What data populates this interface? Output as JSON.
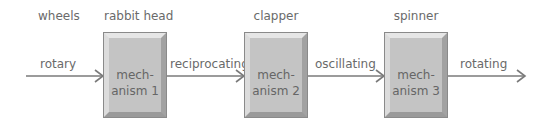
{
  "diagram": {
    "top_labels": [
      "wheels",
      "rabbit head",
      "clapper",
      "spinner"
    ],
    "motions": [
      "rotary",
      "reciprocating",
      "oscillating",
      "rotating"
    ],
    "mechanisms": [
      {
        "line1": "mech-",
        "line2": "anism 1"
      },
      {
        "line1": "mech-",
        "line2": "anism 2"
      },
      {
        "line1": "mech-",
        "line2": "anism 3"
      }
    ],
    "colors": {
      "arrow": "#7a7a7a",
      "box": "#c4c4c4",
      "text": "#6a6a6a"
    }
  }
}
